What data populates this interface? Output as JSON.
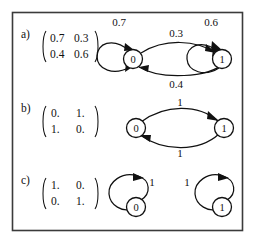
{
  "figure": {
    "caption_rows": [
      {
        "id": "a",
        "label": "a)"
      },
      {
        "id": "b",
        "label": "b)"
      },
      {
        "id": "c",
        "label": "c)"
      }
    ],
    "border_color": "#3b3b3b",
    "ink_color": "#111111",
    "background_color": "#ffffff"
  },
  "rows": {
    "a": {
      "row_label": "a)",
      "matrix": {
        "rows": [
          [
            "0.7",
            "0.3"
          ],
          [
            "0.4",
            "0.6"
          ]
        ]
      },
      "graph": {
        "nodes": [
          {
            "name": "state-0",
            "label": "0"
          },
          {
            "name": "state-1",
            "label": "1"
          }
        ],
        "edges": [
          {
            "name": "self-loop-0",
            "from": "0",
            "to": "0",
            "label": "0.7"
          },
          {
            "name": "edge-0-to-1",
            "from": "0",
            "to": "1",
            "label": "0.3"
          },
          {
            "name": "edge-1-to-0",
            "from": "1",
            "to": "0",
            "label": "0.4"
          },
          {
            "name": "self-loop-1",
            "from": "1",
            "to": "1",
            "label": "0.6"
          }
        ]
      }
    },
    "b": {
      "row_label": "b)",
      "matrix": {
        "rows": [
          [
            "0.",
            "1."
          ],
          [
            "1.",
            "0."
          ]
        ]
      },
      "graph": {
        "nodes": [
          {
            "name": "state-0",
            "label": "0"
          },
          {
            "name": "state-1",
            "label": "1"
          }
        ],
        "edges": [
          {
            "name": "edge-0-to-1",
            "from": "0",
            "to": "1",
            "label": "1"
          },
          {
            "name": "edge-1-to-0",
            "from": "1",
            "to": "0",
            "label": "1"
          }
        ]
      }
    },
    "c": {
      "row_label": "c)",
      "matrix": {
        "rows": [
          [
            "1.",
            "0."
          ],
          [
            "0.",
            "1."
          ]
        ]
      },
      "graph": {
        "nodes": [
          {
            "name": "state-0",
            "label": "0"
          },
          {
            "name": "state-1",
            "label": "1"
          }
        ],
        "edges": [
          {
            "name": "self-loop-0",
            "from": "0",
            "to": "0",
            "label": "1"
          },
          {
            "name": "self-loop-1",
            "from": "1",
            "to": "1",
            "label": "1"
          }
        ]
      }
    }
  }
}
